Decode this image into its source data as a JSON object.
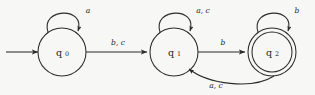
{
  "diagram": {
    "kind": "finite-state-automaton",
    "stroke_color": "#2b2b2b",
    "background_color": "#f7f7f5",
    "states": [
      {
        "id": "q0",
        "label_base": "q",
        "label_sub": "0",
        "cx": 62,
        "cy": 52,
        "r": 24,
        "accepting": false,
        "start": true
      },
      {
        "id": "q1",
        "label_base": "q",
        "label_sub": "1",
        "cx": 174,
        "cy": 52,
        "r": 24,
        "accepting": false,
        "start": false
      },
      {
        "id": "q2",
        "label_base": "q",
        "label_sub": "2",
        "cx": 272,
        "cy": 52,
        "r": 24,
        "accepting": true,
        "start": false
      }
    ],
    "self_loops": [
      {
        "id": "loop-q0",
        "state": "q0",
        "label": "a",
        "label_x": 88,
        "label_y": 11
      },
      {
        "id": "loop-q1",
        "state": "q1",
        "label": "a, c",
        "label_x": 203,
        "label_y": 11
      },
      {
        "id": "loop-q2",
        "state": "q2",
        "label": "b",
        "label_x": 297,
        "label_y": 11
      }
    ],
    "transitions": [
      {
        "id": "q0-q1",
        "from": "q0",
        "to": "q1",
        "label": "b, c",
        "label_x": 118,
        "label_y": 43
      },
      {
        "id": "q1-q2",
        "from": "q1",
        "to": "q2",
        "label": "b",
        "label_x": 223,
        "label_y": 43
      },
      {
        "id": "q2-q1",
        "from": "q2",
        "to": "q1",
        "label": "a, c",
        "label_x": 216,
        "label_y": 86
      }
    ],
    "start_arrow": {
      "id": "start-arrow",
      "from_x": 6,
      "to_x": 38,
      "y": 52
    }
  }
}
